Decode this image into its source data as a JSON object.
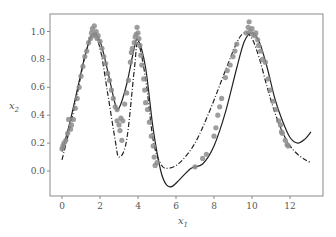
{
  "chart_data": {
    "type": "line",
    "title": "",
    "xlabel": "x1",
    "ylabel": "x2",
    "xlim": [
      -0.5,
      13.8
    ],
    "ylim": [
      -0.16,
      1.12
    ],
    "xticks": [
      0,
      2,
      4,
      6,
      8,
      10,
      12
    ],
    "yticks": [
      0.0,
      0.2,
      0.4,
      0.6,
      0.8,
      1.0
    ],
    "xtick_labels": [
      "0",
      "2",
      "4",
      "6",
      "8",
      "10",
      "12"
    ],
    "ytick_labels": [
      "0.0",
      "0.2",
      "0.4",
      "0.6",
      "0.8",
      "1.0"
    ],
    "grid": false,
    "legend": null,
    "series": [
      {
        "name": "fitted model",
        "style": "solid",
        "color": "#222222",
        "x": [
          0.0,
          0.4,
          0.8,
          1.2,
          1.6,
          2.0,
          2.4,
          2.8,
          3.0,
          3.4,
          3.8,
          4.0,
          4.4,
          4.8,
          5.2,
          5.5,
          5.8,
          6.2,
          6.8,
          7.4,
          8.0,
          8.6,
          9.2,
          9.6,
          10.0,
          10.4,
          10.8,
          11.2,
          11.6,
          12.0,
          12.4,
          12.8,
          13.1
        ],
        "y": [
          0.14,
          0.34,
          0.58,
          0.82,
          0.98,
          0.93,
          0.72,
          0.48,
          0.45,
          0.62,
          0.88,
          0.94,
          0.74,
          0.3,
          0.0,
          -0.1,
          -0.11,
          -0.06,
          0.02,
          0.05,
          0.18,
          0.42,
          0.74,
          0.93,
          0.99,
          0.92,
          0.74,
          0.52,
          0.36,
          0.24,
          0.2,
          0.23,
          0.28
        ]
      },
      {
        "name": "reference",
        "style": "dashdot",
        "color": "#222222",
        "x": [
          0.0,
          0.4,
          0.8,
          1.2,
          1.6,
          2.0,
          2.4,
          2.8,
          3.0,
          3.4,
          3.8,
          4.0,
          4.4,
          4.8,
          5.2,
          5.6,
          6.2,
          7.0,
          7.8,
          8.6,
          9.2,
          9.6,
          10.0,
          10.4,
          10.8,
          11.2,
          11.6,
          12.0,
          12.4,
          12.8,
          13.1
        ],
        "y": [
          0.08,
          0.3,
          0.55,
          0.82,
          0.98,
          0.88,
          0.56,
          0.22,
          0.1,
          0.22,
          0.72,
          0.92,
          0.66,
          0.22,
          0.05,
          0.02,
          0.06,
          0.2,
          0.44,
          0.72,
          0.92,
          0.99,
          0.95,
          0.8,
          0.6,
          0.42,
          0.28,
          0.18,
          0.12,
          0.08,
          0.06
        ]
      }
    ],
    "scatter": {
      "name": "observations",
      "color": "#8c8c8c",
      "points": [
        [
          0.0,
          0.16
        ],
        [
          0.05,
          0.18
        ],
        [
          0.1,
          0.2
        ],
        [
          0.2,
          0.22
        ],
        [
          0.3,
          0.27
        ],
        [
          0.35,
          0.37
        ],
        [
          0.45,
          0.3
        ],
        [
          0.5,
          0.33
        ],
        [
          0.6,
          0.37
        ],
        [
          0.7,
          0.45
        ],
        [
          0.8,
          0.52
        ],
        [
          0.9,
          0.6
        ],
        [
          1.0,
          0.68
        ],
        [
          1.1,
          0.75
        ],
        [
          1.2,
          0.82
        ],
        [
          1.3,
          0.86
        ],
        [
          1.4,
          0.92
        ],
        [
          1.5,
          0.95
        ],
        [
          1.55,
          0.99
        ],
        [
          1.6,
          1.02
        ],
        [
          1.65,
          0.97
        ],
        [
          1.7,
          1.04
        ],
        [
          1.75,
          0.98
        ],
        [
          1.8,
          1.0
        ],
        [
          1.85,
          0.95
        ],
        [
          1.9,
          0.97
        ],
        [
          2.0,
          0.93
        ],
        [
          2.1,
          0.88
        ],
        [
          2.2,
          0.82
        ],
        [
          2.3,
          0.77
        ],
        [
          2.4,
          0.7
        ],
        [
          2.5,
          0.65
        ],
        [
          2.6,
          0.58
        ],
        [
          2.7,
          0.52
        ],
        [
          2.8,
          0.46
        ],
        [
          2.9,
          0.44
        ],
        [
          2.9,
          0.36
        ],
        [
          3.0,
          0.33
        ],
        [
          3.05,
          0.29
        ],
        [
          3.1,
          0.38
        ],
        [
          3.15,
          0.22
        ],
        [
          3.2,
          0.36
        ],
        [
          3.3,
          0.48
        ],
        [
          3.4,
          0.56
        ],
        [
          3.5,
          0.65
        ],
        [
          3.6,
          0.78
        ],
        [
          3.65,
          0.85
        ],
        [
          3.7,
          0.88
        ],
        [
          3.8,
          0.92
        ],
        [
          3.85,
          0.96
        ],
        [
          3.9,
          0.98
        ],
        [
          3.95,
          1.03
        ],
        [
          4.0,
          0.99
        ],
        [
          4.05,
          0.95
        ],
        [
          4.1,
          0.9
        ],
        [
          4.15,
          0.83
        ],
        [
          4.2,
          0.76
        ],
        [
          4.3,
          0.66
        ],
        [
          4.35,
          0.58
        ],
        [
          4.4,
          0.49
        ],
        [
          4.5,
          0.44
        ],
        [
          4.6,
          0.35
        ],
        [
          4.7,
          0.25
        ],
        [
          4.8,
          0.18
        ],
        [
          4.85,
          0.1
        ],
        [
          4.9,
          0.04
        ],
        [
          5.0,
          0.06
        ],
        [
          7.0,
          0.03
        ],
        [
          7.4,
          0.09
        ],
        [
          7.6,
          0.12
        ],
        [
          8.0,
          0.25
        ],
        [
          8.1,
          0.31
        ],
        [
          8.2,
          0.4
        ],
        [
          8.3,
          0.46
        ],
        [
          8.4,
          0.52
        ],
        [
          8.6,
          0.67
        ],
        [
          8.7,
          0.72
        ],
        [
          8.85,
          0.76
        ],
        [
          9.0,
          0.82
        ],
        [
          9.1,
          0.86
        ],
        [
          9.2,
          0.91
        ],
        [
          9.7,
          0.99
        ],
        [
          9.8,
          1.03
        ],
        [
          9.85,
          1.07
        ],
        [
          9.9,
          1.0
        ],
        [
          10.0,
          1.02
        ],
        [
          10.05,
          0.98
        ],
        [
          10.15,
          0.97
        ],
        [
          10.2,
          0.99
        ],
        [
          10.3,
          0.94
        ],
        [
          10.35,
          0.9
        ],
        [
          10.45,
          0.86
        ],
        [
          10.55,
          0.8
        ],
        [
          10.7,
          0.78
        ],
        [
          10.85,
          0.66
        ],
        [
          10.95,
          0.58
        ],
        [
          11.1,
          0.5
        ],
        [
          11.25,
          0.44
        ],
        [
          11.4,
          0.36
        ],
        [
          11.5,
          0.33
        ],
        [
          11.55,
          0.28
        ],
        [
          11.6,
          0.27
        ],
        [
          11.75,
          0.22
        ],
        [
          11.85,
          0.19
        ],
        [
          11.9,
          0.18
        ]
      ]
    }
  },
  "layout": {
    "plot": {
      "left": 50,
      "top": 14,
      "right": 323,
      "bottom": 196
    },
    "x_px_per_unit": 19.0,
    "x_px_origin": 62,
    "y_px_per_unit": 139.5,
    "y_px_origin": 171
  }
}
